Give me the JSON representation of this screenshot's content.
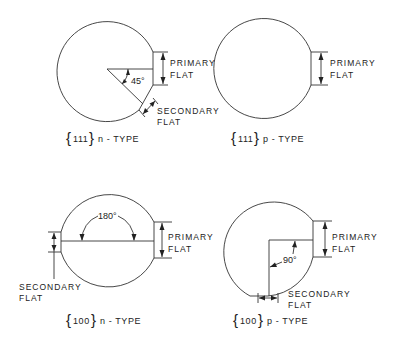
{
  "diagram": {
    "panels": [
      {
        "id": "111-n",
        "caption_orientation": "111",
        "caption_type": "n - TYPE",
        "primary_label_1": "PRIMARY",
        "primary_label_2": "FLAT",
        "secondary_label_1": "SECONDARY",
        "secondary_label_2": "FLAT",
        "angle_label": "45°"
      },
      {
        "id": "111-p",
        "caption_orientation": "111",
        "caption_type": "p - TYPE",
        "primary_label_1": "PRIMARY",
        "primary_label_2": "FLAT"
      },
      {
        "id": "100-n",
        "caption_orientation": "100",
        "caption_type": "n - TYPE",
        "primary_label_1": "PRIMARY",
        "primary_label_2": "FLAT",
        "secondary_label_1": "SECONDARY",
        "secondary_label_2": "FLAT",
        "angle_label": "180°"
      },
      {
        "id": "100-p",
        "caption_orientation": "100",
        "caption_type": "p - TYPE",
        "primary_label_1": "PRIMARY",
        "primary_label_2": "FLAT",
        "secondary_label_1": "SECONDARY",
        "secondary_label_2": "FLAT",
        "angle_label": "90°"
      }
    ]
  }
}
